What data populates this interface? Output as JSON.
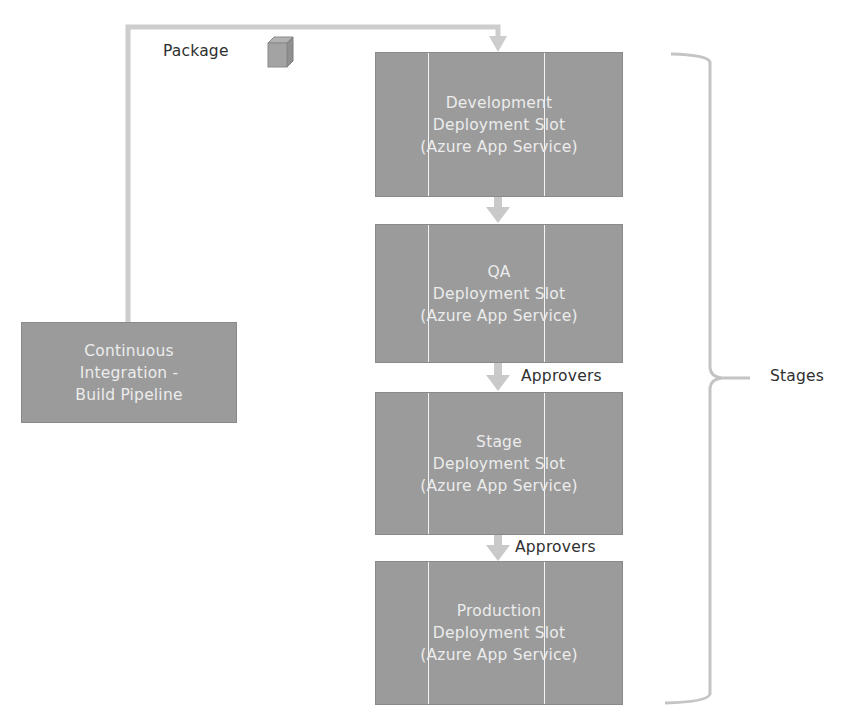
{
  "diagram": {
    "title_fragment": "",
    "package_label": "Package",
    "package_icon": "package-cube-icon",
    "ci_box": {
      "lines": [
        "Continuous",
        "Integration -",
        "Build Pipeline"
      ]
    },
    "stages": [
      {
        "id": "development",
        "lines": [
          "Development",
          "Deployment Slot",
          "(Azure App Service)"
        ]
      },
      {
        "id": "qa",
        "lines": [
          "QA",
          "Deployment Slot",
          "(Azure App Service)"
        ]
      },
      {
        "id": "stage",
        "lines": [
          "Stage",
          "Deployment Slot",
          "(Azure App Service)"
        ]
      },
      {
        "id": "production",
        "lines": [
          "Production",
          "Deployment Slot",
          "(Azure App Service)"
        ]
      }
    ],
    "approvers_labels": [
      "Approvers",
      "Approvers"
    ],
    "brace_label": "Stages",
    "colors": {
      "box_fill": "#9b9b9b",
      "box_text": "#ececec",
      "connector": "#c9c9c9",
      "label_text": "#2f2f2f"
    }
  }
}
